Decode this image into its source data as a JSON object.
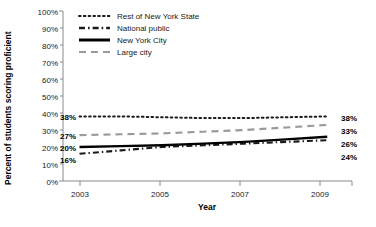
{
  "chart_data": {
    "type": "line",
    "title": "",
    "xlabel": "Year",
    "ylabel": "Percent of students scoring proficient",
    "x": [
      2003,
      2004,
      2005,
      2006,
      2007,
      2008,
      2009
    ],
    "xlim": [
      2002.6,
      2009.6
    ],
    "ylim": [
      0,
      100
    ],
    "xticks": [
      2003,
      2005,
      2007,
      2009
    ],
    "xticklabels": [
      "2003",
      "2005",
      "2007",
      "2009"
    ],
    "yticks": [
      0,
      10,
      20,
      30,
      40,
      50,
      60,
      70,
      80,
      90,
      100
    ],
    "yticklabels": [
      "0%",
      "10%",
      "20%",
      "30%",
      "40%",
      "50%",
      "60%",
      "70%",
      "80%",
      "90%",
      "100%"
    ],
    "grid": false,
    "legend_position": "top-center",
    "series": [
      {
        "name": "Rest of New York State",
        "style": "dotted",
        "color": "#1a1a1a",
        "values": [
          38,
          38,
          37.5,
          37,
          37,
          37.5,
          38
        ],
        "start_label": "38%",
        "end_label": "38%"
      },
      {
        "name": "National public",
        "style": "dash-dot",
        "color": "#1a1a1a",
        "values": [
          16,
          18,
          20,
          21,
          22,
          23,
          24
        ],
        "start_label": "16%",
        "end_label": "24%"
      },
      {
        "name": "New York City",
        "style": "solid",
        "color": "#000000",
        "values": [
          20,
          20.5,
          21,
          22,
          23,
          24.5,
          26
        ],
        "start_label": "20%",
        "end_label": "26%"
      },
      {
        "name": "Large city",
        "style": "dashed",
        "color": "#9a9a9a",
        "values": [
          27,
          27.5,
          28,
          29,
          30,
          31.5,
          33
        ],
        "start_label": "27%",
        "end_label": "33%"
      }
    ]
  },
  "legend": {
    "items": [
      {
        "label": "Rest of New York State"
      },
      {
        "label": "National public"
      },
      {
        "label": "New York City"
      },
      {
        "label": "Large city"
      }
    ]
  },
  "axes": {
    "ylabel": "Percent of students scoring proficient",
    "xlabel": "Year",
    "ytick_0": "0%",
    "ytick_1": "10%",
    "ytick_2": "20%",
    "ytick_3": "30%",
    "ytick_4": "40%",
    "ytick_5": "50%",
    "ytick_6": "60%",
    "ytick_7": "70%",
    "ytick_8": "80%",
    "ytick_9": "90%",
    "ytick_10": "100%",
    "xtick_0": "2003",
    "xtick_1": "2005",
    "xtick_2": "2007",
    "xtick_3": "2009"
  },
  "start_labels": {
    "l0": "38%",
    "l1": "27%",
    "l2": "20%",
    "l3": "16%"
  },
  "end_labels": {
    "l0": "38%",
    "l1": "33%",
    "l2": "26%",
    "l3": "24%"
  }
}
